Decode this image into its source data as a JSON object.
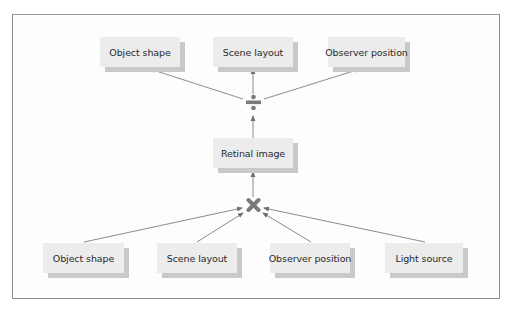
{
  "diagram": {
    "type": "flow",
    "top_row": [
      {
        "id": "top-object-shape",
        "label": "Object shape"
      },
      {
        "id": "top-scene-layout",
        "label": "Scene layout"
      },
      {
        "id": "top-observer-position",
        "label": "Observer position"
      }
    ],
    "divide_operator": {
      "symbol": "÷",
      "name": "divide"
    },
    "middle": {
      "id": "retinal-image",
      "label": "Retinal image"
    },
    "multiply_operator": {
      "symbol": "✖",
      "name": "multiply"
    },
    "bottom_row": [
      {
        "id": "bottom-object-shape",
        "label": "Object shape"
      },
      {
        "id": "bottom-scene-layout",
        "label": "Scene layout"
      },
      {
        "id": "bottom-observer-position",
        "label": "Observer position"
      },
      {
        "id": "bottom-light-source",
        "label": "Light source"
      }
    ],
    "edges": [
      {
        "from": "bottom-object-shape",
        "to": "multiply"
      },
      {
        "from": "bottom-scene-layout",
        "to": "multiply"
      },
      {
        "from": "bottom-observer-position",
        "to": "multiply"
      },
      {
        "from": "bottom-light-source",
        "to": "multiply"
      },
      {
        "from": "multiply",
        "to": "retinal-image"
      },
      {
        "from": "retinal-image",
        "to": "divide"
      },
      {
        "from": "divide",
        "to": "top-object-shape"
      },
      {
        "from": "divide",
        "to": "top-scene-layout"
      },
      {
        "from": "divide",
        "to": "top-observer-position"
      }
    ],
    "colors": {
      "box_fill": "#ececec",
      "box_shadow": "#c9c9c9",
      "line": "#6e6e6e",
      "operator": "#7a7a7a",
      "frame": "#8a8a8a"
    }
  }
}
